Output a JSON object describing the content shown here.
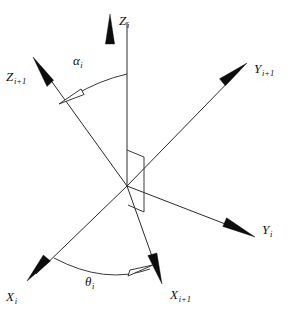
{
  "figure": {
    "kind": "coordinate-frame-diagram",
    "background_color": "#ffffff",
    "line_color": "#2b2b2b",
    "text_color": "#111111",
    "width": 294,
    "height": 320
  },
  "origin": {
    "x": 127,
    "y": 186
  },
  "axes": [
    {
      "id": "z-i",
      "base": "Z",
      "subscript": "i",
      "label_x": 119,
      "label_y": 14,
      "arrow_name": "z-i-arrowhead",
      "tip": {
        "x": 110,
        "y": 14
      },
      "tail": {
        "x": 127,
        "y": 186
      }
    },
    {
      "id": "z-i-plus-1",
      "base": "Z",
      "subscript": "i+1",
      "label_x": 6,
      "label_y": 70,
      "arrow_name": "z-i-plus-1-arrowhead",
      "tip": {
        "x": 33,
        "y": 57
      },
      "tail": {
        "x": 127,
        "y": 186
      }
    },
    {
      "id": "y-i-plus-1",
      "base": "Y",
      "subscript": "i+1",
      "label_x": 254,
      "label_y": 62,
      "arrow_name": "y-i-plus-1-arrowhead",
      "tip": {
        "x": 247,
        "y": 63
      },
      "tail": {
        "x": 127,
        "y": 186
      }
    },
    {
      "id": "y-i",
      "base": "Y",
      "subscript": "i",
      "label_x": 262,
      "label_y": 223,
      "arrow_name": "y-i-arrowhead",
      "tip": {
        "x": 255,
        "y": 237
      },
      "tail": {
        "x": 127,
        "y": 186
      }
    },
    {
      "id": "x-i",
      "base": "X",
      "subscript": "i",
      "label_x": 6,
      "label_y": 290,
      "arrow_name": "x-i-arrowhead",
      "tip": {
        "x": 27,
        "y": 281
      },
      "tail": {
        "x": 127,
        "y": 186
      }
    },
    {
      "id": "x-i-plus-1",
      "base": "X",
      "subscript": "i+1",
      "label_x": 170,
      "label_y": 288,
      "arrow_name": "x-i-plus-1-arrowhead",
      "tip": {
        "x": 162,
        "y": 284
      },
      "tail": {
        "x": 127,
        "y": 186
      }
    }
  ],
  "angles": [
    {
      "id": "alpha-i",
      "symbol": "α",
      "subscript": "i",
      "label_x": 73,
      "label_y": 54,
      "arc_name": "alpha-arc",
      "arrow_name": "alpha-arc-arrowhead",
      "between": [
        "z-i",
        "z-i-plus-1"
      ]
    },
    {
      "id": "theta-i",
      "symbol": "θ",
      "subscript": "i",
      "label_x": 85,
      "label_y": 275,
      "arc_name": "theta-arc",
      "arrow_name": "theta-arc-arrowhead",
      "between": [
        "x-i",
        "x-i-plus-1"
      ]
    }
  ],
  "markers": [
    {
      "id": "perpendicular-plane-marker",
      "name": "right-angle-plane-marker",
      "points": "127,150 144,156 144,212 127,205"
    }
  ]
}
